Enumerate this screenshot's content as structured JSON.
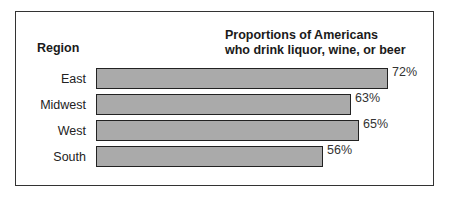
{
  "chart_data": {
    "type": "bar",
    "orientation": "horizontal",
    "title": "Proportions of Americans who drink liquor, wine, or beer",
    "title_lines": [
      "Proportions of Americans",
      "who drink liquor, wine, or beer"
    ],
    "ylabel": "Region",
    "xlabel": "",
    "categories": [
      "East",
      "Midwest",
      "West",
      "South"
    ],
    "values": [
      72,
      63,
      65,
      56
    ],
    "value_labels": [
      "72%",
      "63%",
      "65%",
      "56%"
    ],
    "unit": "%",
    "grid": false,
    "legend": null,
    "bar_color": "#aaaaaa",
    "bar_border_color": "#222222"
  }
}
